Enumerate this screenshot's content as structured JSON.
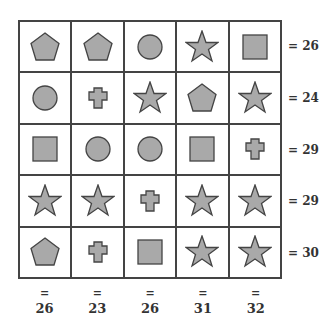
{
  "puzzle": {
    "grid": [
      [
        "pentagon",
        "pentagon",
        "circle",
        "star",
        "square"
      ],
      [
        "circle",
        "cross",
        "star",
        "pentagon",
        "star"
      ],
      [
        "square",
        "circle",
        "circle",
        "square",
        "cross"
      ],
      [
        "star",
        "star",
        "cross",
        "star",
        "star"
      ],
      [
        "pentagon",
        "cross",
        "square",
        "star",
        "star"
      ]
    ],
    "row_sums": [
      "= 26",
      "= 24",
      "= 29",
      "= 29",
      "= 30"
    ],
    "col_eq": "=",
    "col_sums": [
      "26",
      "23",
      "26",
      "31",
      "32"
    ],
    "colors": {
      "fill": "#a9a9a9",
      "stroke": "#444444",
      "grid": "#444444"
    }
  }
}
